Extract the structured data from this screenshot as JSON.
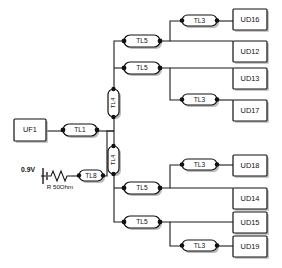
{
  "diagram": {
    "type": "circuit-schematic",
    "colors": {
      "background": "#ffffff",
      "wire": "#1a1a1a",
      "outline": "#111111",
      "shadow": "#8d8d8d"
    }
  },
  "sources": {
    "generator": {
      "label": "UF1"
    },
    "voltage": {
      "label": "0.9V"
    },
    "resistor": {
      "label": "R 50Ohm"
    }
  },
  "lines": {
    "feed_main": {
      "label": "TL1"
    },
    "feed_aux": {
      "label": "TL8"
    },
    "trunk_upper": {
      "label": "TL4"
    },
    "trunk_lower": {
      "label": "TL4"
    },
    "branch_u1": {
      "label": "TL5"
    },
    "branch_u2": {
      "label": "TL5"
    },
    "branch_l1": {
      "label": "TL5"
    },
    "branch_l2": {
      "label": "TL5"
    },
    "stub_ud16": {
      "label": "TL3"
    },
    "stub_ud17": {
      "label": "TL3"
    },
    "stub_ud18": {
      "label": "TL3"
    },
    "stub_ud19": {
      "label": "TL3"
    }
  },
  "loads": {
    "ud16": {
      "label": "UD16"
    },
    "ud12": {
      "label": "UD12"
    },
    "ud13": {
      "label": "UD13"
    },
    "ud17": {
      "label": "UD17"
    },
    "ud18": {
      "label": "UD18"
    },
    "ud14": {
      "label": "UD14"
    },
    "ud15": {
      "label": "UD15"
    },
    "ud19": {
      "label": "UD19"
    }
  }
}
